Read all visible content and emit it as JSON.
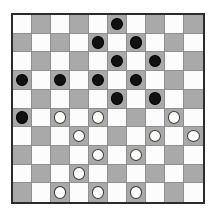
{
  "board": {
    "title": "Checkers Board",
    "rows": 10,
    "columns": 10,
    "light_square_color": "#fcfcfc",
    "dark_square_color": "#a9a9a9",
    "border_color": "#2b2b2b",
    "gridline_color": "#8f8f8f",
    "background_color": "#ffffff",
    "dark_square_rule": "(row + col) % 2 == 1",
    "piece_colors": {
      "black_fill": "#111111",
      "black_outline": "#000000",
      "white_fill": "#fdfdfa",
      "white_outline": "#3a3a3a"
    },
    "piece_counts": {
      "black": 12,
      "white": 12,
      "total": 24
    },
    "squares": [
      [
        "",
        "",
        "",
        "",
        "",
        "black",
        "",
        "",
        "",
        ""
      ],
      [
        "",
        "",
        "",
        "",
        "black",
        "",
        "black",
        "",
        "",
        ""
      ],
      [
        "",
        "",
        "",
        "",
        "",
        "black",
        "",
        "black",
        "",
        ""
      ],
      [
        "black",
        "",
        "black",
        "",
        "black",
        "",
        "black",
        "",
        "",
        ""
      ],
      [
        "",
        "",
        "",
        "",
        "",
        "black",
        "",
        "black",
        "",
        ""
      ],
      [
        "black",
        "",
        "white",
        "",
        "white",
        "",
        "",
        "",
        "white",
        ""
      ],
      [
        "",
        "",
        "",
        "white",
        "",
        "",
        "",
        "white",
        "",
        "white"
      ],
      [
        "",
        "",
        "",
        "",
        "white",
        "",
        "white",
        "",
        "",
        ""
      ],
      [
        "",
        "",
        "",
        "white",
        "",
        "",
        "",
        "",
        "",
        ""
      ],
      [
        "",
        "",
        "white",
        "",
        "white",
        "",
        "white",
        "",
        "",
        ""
      ]
    ]
  }
}
